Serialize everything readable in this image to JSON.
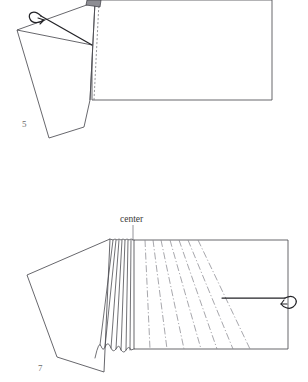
{
  "document": {
    "type": "instructional-folding-diagram",
    "background_color": "#ffffff",
    "width": 308,
    "height": 382,
    "ink_color": "#4c4c52",
    "accent_color": "#232327",
    "label_color": "#6b6b6b"
  },
  "figures": [
    {
      "id": "figure-5",
      "number_label": "5",
      "number_position": {
        "x": 22,
        "y": 127
      },
      "description": "Rectangular sheet with a tilted flap folded back at the left, a dashed fold line, a small shaded corner tab at the top, and a curled motion arrow indicating the roll direction",
      "main_panel": {
        "name": "main-sheet",
        "points": "92,0 272,0 272,100 92,100"
      },
      "flap": {
        "name": "folded-flap",
        "points": "95,2 90,100 84,127 49,138 17,30"
      },
      "fold_line": {
        "name": "fold-line-solid",
        "points": "95,2 90,100"
      },
      "fold_line_dashed": {
        "name": "fold-line-dashed",
        "points": "99,3 94,100"
      },
      "inner_crease": {
        "name": "flap-inner-crease",
        "points": "17,30 92,45"
      },
      "shaded_tab": {
        "name": "corner-tab-shaded",
        "points": "88,0 101,0 100,7 87,6"
      },
      "arrow": {
        "name": "roll-motion-arrow",
        "label": "roll direction",
        "path": "M 92,45 L 40,16 C 30,10 28,22 38,20"
      }
    },
    {
      "id": "figure-7",
      "number_label": "7",
      "number_position": {
        "x": 38,
        "y": 371
      },
      "description": "Sheet with accordion pleats gathered at the center, radiating dash-dot crease lines across the right panel, a flap at the left, and a curled arrow at the right edge",
      "callout": {
        "name": "center-callout",
        "text": "center",
        "text_position": {
          "x": 120,
          "y": 222
        },
        "leader_from": {
          "x": 133,
          "y": 225
        },
        "leader_to": {
          "x": 133,
          "y": 241
        }
      },
      "right_panel": {
        "name": "right-sheet-panel",
        "points": "134,240 288,240 288,349 134,349"
      },
      "flap": {
        "name": "left-flap-panel",
        "points": "110,239 27,275 57,357 104,372"
      },
      "pleats": {
        "name": "accordion-pleats",
        "count": 7,
        "top_y": 240,
        "bottom_y": 352,
        "top_x_start": 113,
        "top_x_end": 133,
        "bottom_x_start": 100,
        "bottom_x_end": 134
      },
      "creases": {
        "name": "radiating-creases",
        "count": 7,
        "style": "dash-dot",
        "top_x_start": 145,
        "top_x_end": 198,
        "bottom_x_start": 150,
        "bottom_x_end": 250
      },
      "arrow": {
        "name": "wrap-motion-arrow",
        "label": "wrap direction",
        "path": "M 222,298 L 286,298 C 298,295 296,311 284,305"
      }
    }
  ]
}
